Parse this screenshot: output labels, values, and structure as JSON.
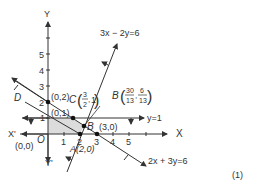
{
  "figure": {
    "number_label": "(1)",
    "axes": {
      "x_label": "X",
      "x_neg_label": "X'",
      "y_label": "Y",
      "y_neg_label": "Y'",
      "origin_label": "O",
      "origin_coord": "(0,0)",
      "x_ticks": [
        "1",
        "2",
        "3",
        "4",
        "5"
      ],
      "y_ticks": [
        "1",
        "2",
        "3",
        "4",
        "5"
      ]
    },
    "lines": [
      {
        "name": "line-3x-2y",
        "equation": "3x − 2y=6"
      },
      {
        "name": "line-2x-3y",
        "equation": "2x + 3y=6"
      },
      {
        "name": "line-y1",
        "equation": "y=1"
      }
    ],
    "points": {
      "A": {
        "label": "A(2,0)"
      },
      "B": {
        "label": "B",
        "num_x": "30",
        "den_x": "13",
        "num_y": "6",
        "den_y": "13"
      },
      "C": {
        "label": "C",
        "num_x": "3",
        "den_x": "2",
        "y": "1"
      },
      "D": {
        "label": "D"
      },
      "p02": {
        "label": "(0,2)"
      },
      "p01": {
        "label": "(0,1)"
      },
      "p30": {
        "label": "(3,0)"
      }
    },
    "colors": {
      "line": "#333333",
      "shade": "#dcdcdc"
    }
  }
}
